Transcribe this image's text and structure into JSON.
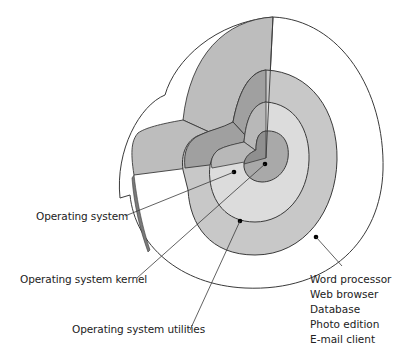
{
  "diagram": {
    "type": "nested layered shells (cutaway)",
    "colors": {
      "outer_white": "#ffffff",
      "utilities_ring": "#c8c8c8",
      "os_ring": "#dcdcdc",
      "kernel_core": "#a9a9a9",
      "cut_face_light": "#bdbdbd",
      "cut_face_mid": "#a0a0a0",
      "stroke": "#3a3a3a"
    },
    "labels": {
      "operating_system": "Operating system",
      "kernel": "Operating system kernel",
      "utilities": "Operating system utilities"
    },
    "applications": [
      "Word processor",
      "Web browser",
      "Database",
      "Photo edition",
      "E-mail client"
    ]
  }
}
